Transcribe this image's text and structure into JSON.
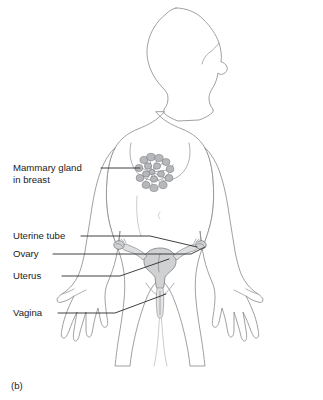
{
  "figure": {
    "caption": "(b)",
    "background_color": "#ffffff",
    "outline_color": "#8d8f92",
    "leader_color": "#2a2a2a",
    "organ_color": "#cfd1d3",
    "text_color": "#1b1b1b"
  },
  "labels": [
    {
      "id": "mammary-gland",
      "line1": "Mammary gland",
      "line2": "in breast",
      "icon": "leader-line-icon"
    },
    {
      "id": "uterine-tube",
      "line1": "Uterine tube",
      "line2": "",
      "icon": "leader-line-icon"
    },
    {
      "id": "ovary",
      "line1": "Ovary",
      "line2": "",
      "icon": "leader-line-icon"
    },
    {
      "id": "uterus",
      "line1": "Uterus",
      "line2": "",
      "icon": "leader-line-icon"
    },
    {
      "id": "vagina",
      "line1": "Vagina",
      "line2": "",
      "icon": "leader-line-icon"
    }
  ]
}
